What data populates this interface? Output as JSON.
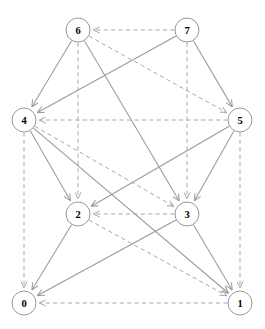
{
  "figure": {
    "type": "directed-graph-diagram",
    "title": "",
    "background_color": "#ffffff",
    "width": 265,
    "height": 329
  },
  "style": {
    "node_fill": "#ffffff",
    "node_stroke": "#8c8c8c",
    "node_label_color": "#000000",
    "node_radius": 12,
    "solid_edge_color": "#9a9a9a",
    "dashed_edge_color": "#a8a8a8",
    "dash_pattern": "4.2 3.2",
    "arrowhead": "open-v"
  },
  "chart_data": {
    "type": "graph",
    "title": "",
    "directed": true,
    "node_count": 8,
    "edge_count": 20,
    "nodes": [
      {
        "id": "0",
        "label": "0",
        "x": 24,
        "y": 303
      },
      {
        "id": "1",
        "label": "1",
        "x": 240,
        "y": 303
      },
      {
        "id": "2",
        "label": "2",
        "x": 78,
        "y": 214
      },
      {
        "id": "3",
        "label": "3",
        "x": 187,
        "y": 214
      },
      {
        "id": "4",
        "label": "4",
        "x": 24,
        "y": 120
      },
      {
        "id": "5",
        "label": "5",
        "x": 240,
        "y": 120
      },
      {
        "id": "6",
        "label": "6",
        "x": 78,
        "y": 30
      },
      {
        "id": "7",
        "label": "7",
        "x": 187,
        "y": 30
      }
    ],
    "edges": [
      {
        "from": "7",
        "to": "6",
        "style": "dashed"
      },
      {
        "from": "6",
        "to": "4",
        "style": "solid"
      },
      {
        "from": "7",
        "to": "4",
        "style": "solid"
      },
      {
        "from": "7",
        "to": "5",
        "style": "solid"
      },
      {
        "from": "6",
        "to": "5",
        "style": "dashed"
      },
      {
        "from": "5",
        "to": "4",
        "style": "dashed"
      },
      {
        "from": "6",
        "to": "2",
        "style": "dashed"
      },
      {
        "from": "7",
        "to": "3",
        "style": "dashed"
      },
      {
        "from": "6",
        "to": "3",
        "style": "solid"
      },
      {
        "from": "4",
        "to": "2",
        "style": "solid"
      },
      {
        "from": "4",
        "to": "3",
        "style": "dashed"
      },
      {
        "from": "5",
        "to": "2",
        "style": "solid"
      },
      {
        "from": "5",
        "to": "3",
        "style": "solid"
      },
      {
        "from": "3",
        "to": "2",
        "style": "dashed"
      },
      {
        "from": "4",
        "to": "0",
        "style": "dashed"
      },
      {
        "from": "5",
        "to": "1",
        "style": "dashed"
      },
      {
        "from": "4",
        "to": "1",
        "style": "solid"
      },
      {
        "from": "2",
        "to": "0",
        "style": "solid"
      },
      {
        "from": "2",
        "to": "1",
        "style": "dashed"
      },
      {
        "from": "3",
        "to": "0",
        "style": "solid"
      },
      {
        "from": "3",
        "to": "1",
        "style": "solid"
      },
      {
        "from": "1",
        "to": "0",
        "style": "dashed"
      }
    ]
  }
}
